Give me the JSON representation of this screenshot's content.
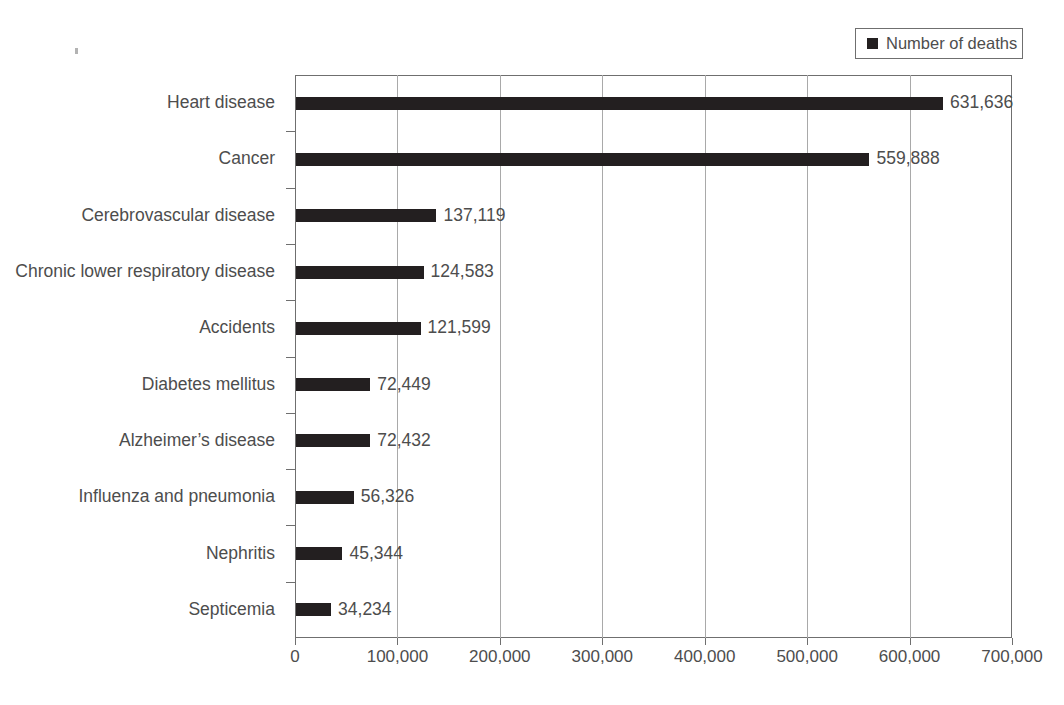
{
  "legend": {
    "label": "Number of deaths",
    "swatch_color": "#231f20"
  },
  "axis": {
    "x_ticks": [
      "0",
      "100,000",
      "200,000",
      "300,000",
      "400,000",
      "500,000",
      "600,000",
      "700,000"
    ]
  },
  "colors": {
    "bar": "#231f20",
    "text": "#4d4d4d",
    "grid": "#a9a9a9",
    "frame": "#6f6f6f",
    "background": "#ffffff"
  },
  "chart_data": {
    "type": "bar",
    "orientation": "horizontal",
    "title": "",
    "subtitle": "",
    "xlabel": "",
    "ylabel": "",
    "xlim": [
      0,
      700000
    ],
    "grid": true,
    "legend_position": "top-right",
    "series": [
      {
        "name": "Number of deaths",
        "values": [
          631636,
          559888,
          137119,
          124583,
          121599,
          72449,
          72432,
          56326,
          45344,
          34234
        ]
      }
    ],
    "categories": [
      "Heart disease",
      "Cancer",
      "Cerebrovascular disease",
      "Chronic lower respiratory disease",
      "Accidents",
      "Diabetes mellitus",
      "Alzheimer’s disease",
      "Influenza and pneumonia",
      "Nephritis",
      "Septicemia"
    ],
    "value_labels": [
      "631,636",
      "559,888",
      "137,119",
      "124,583",
      "121,599",
      "72,449",
      "72,432",
      "56,326",
      "45,344",
      "34,234"
    ],
    "tick_values": [
      0,
      100000,
      200000,
      300000,
      400000,
      500000,
      600000,
      700000
    ],
    "tick_labels": [
      "0",
      "100,000",
      "200,000",
      "300,000",
      "400,000",
      "500,000",
      "600,000",
      "700,000"
    ]
  }
}
